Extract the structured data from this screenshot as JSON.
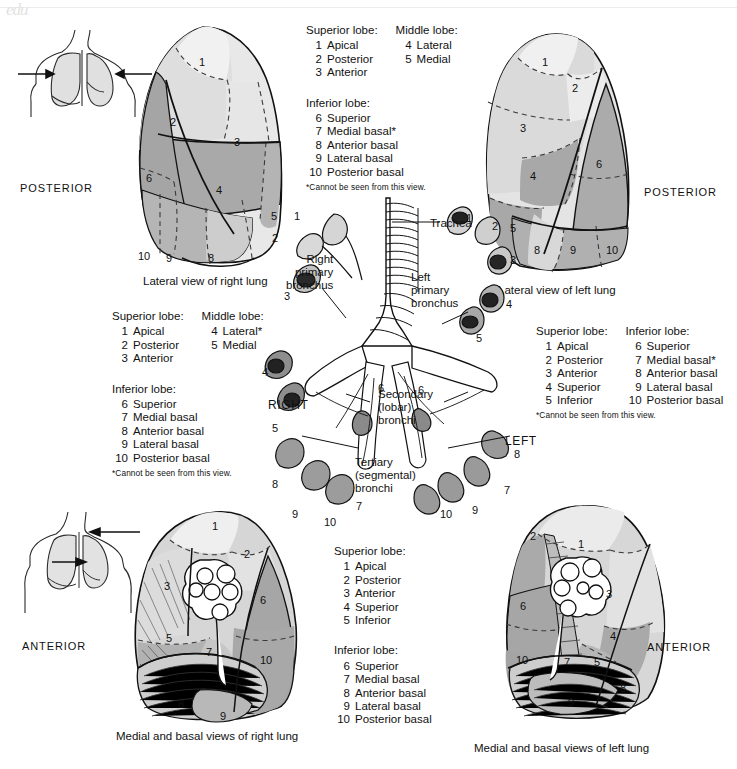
{
  "figure": {
    "title": "Bronchopulmonary segments and bronchial tree",
    "watermark": "edu"
  },
  "orientation_labels": {
    "posterior_left": "POSTERIOR",
    "posterior_right": "POSTERIOR",
    "anterior_left": "ANTERIOR",
    "anterior_right": "ANTERIOR"
  },
  "captions": {
    "lateral_right": "Lateral view of right lung",
    "lateral_left": "Lateral view of left lung",
    "medial_right": "Medial and basal views of right lung",
    "medial_left": "Medial and basal views of left lung"
  },
  "bronchi_labels": {
    "trachea": "Trachea",
    "right_primary": "Right\nprimary\nbronchus",
    "right_primary_lines": [
      "Right",
      "primary",
      "bronchus"
    ],
    "left_primary_lines": [
      "Left",
      "primary",
      "bronchus"
    ],
    "secondary_lines": [
      "Secondary",
      "(lobar)",
      "bronchi"
    ],
    "tertiary_lines": [
      "Tertiary",
      "(segmental)",
      "bronchi"
    ],
    "side_right": "RIGHT",
    "side_left": "LEFT"
  },
  "legends": {
    "top_right_lung": {
      "col1_head": "Superior lobe:",
      "col1": [
        {
          "num": "1",
          "name": "Apical"
        },
        {
          "num": "2",
          "name": "Posterior"
        },
        {
          "num": "3",
          "name": "Anterior"
        }
      ],
      "col2_head": "Middle lobe:",
      "col2": [
        {
          "num": "4",
          "name": "Lateral"
        },
        {
          "num": "5",
          "name": "Medial"
        }
      ],
      "lower_head": "Inferior lobe:",
      "lower": [
        {
          "num": "6",
          "name": "Superior"
        },
        {
          "num": "7",
          "name": "Medial basal*"
        },
        {
          "num": "8",
          "name": "Anterior basal"
        },
        {
          "num": "9",
          "name": "Lateral basal"
        },
        {
          "num": "10",
          "name": "Posterior basal"
        }
      ],
      "footnote": "*Cannot be seen from this view."
    },
    "middle_right_lung": {
      "col1_head": "Superior lobe:",
      "col1": [
        {
          "num": "1",
          "name": "Apical"
        },
        {
          "num": "2",
          "name": "Posterior"
        },
        {
          "num": "3",
          "name": "Anterior"
        }
      ],
      "col2_head": "Middle lobe:",
      "col2": [
        {
          "num": "4",
          "name": "Lateral*"
        },
        {
          "num": "5",
          "name": "Medial"
        }
      ],
      "lower_head": "Inferior lobe:",
      "lower": [
        {
          "num": "6",
          "name": "Superior"
        },
        {
          "num": "7",
          "name": "Medial basal"
        },
        {
          "num": "8",
          "name": "Anterior basal"
        },
        {
          "num": "9",
          "name": "Lateral basal"
        },
        {
          "num": "10",
          "name": "Posterior basal"
        }
      ],
      "footnote": "*Cannot be seen from this view."
    },
    "middle_left_lung": {
      "col1_head": "Superior lobe:",
      "col1": [
        {
          "num": "1",
          "name": "Apical"
        },
        {
          "num": "2",
          "name": "Posterior"
        },
        {
          "num": "3",
          "name": "Anterior"
        },
        {
          "num": "4",
          "name": "Superior"
        },
        {
          "num": "5",
          "name": "Inferior"
        }
      ],
      "col2_head": "Inferior lobe:",
      "col2": [
        {
          "num": "6",
          "name": "Superior"
        },
        {
          "num": "7",
          "name": "Medial basal*"
        },
        {
          "num": "8",
          "name": "Anterior basal"
        },
        {
          "num": "9",
          "name": "Lateral basal"
        },
        {
          "num": "10",
          "name": "Posterior basal"
        }
      ],
      "footnote": "*Cannot be seen from this view."
    },
    "bottom_center": {
      "col1_head": "Superior lobe:",
      "col1": [
        {
          "num": "1",
          "name": "Apical"
        },
        {
          "num": "2",
          "name": "Posterior"
        },
        {
          "num": "3",
          "name": "Anterior"
        },
        {
          "num": "4",
          "name": "Superior"
        },
        {
          "num": "5",
          "name": "Inferior"
        }
      ],
      "lower_head": "Inferior lobe:",
      "lower": [
        {
          "num": "6",
          "name": "Superior"
        },
        {
          "num": "7",
          "name": "Medial basal"
        },
        {
          "num": "8",
          "name": "Anterior basal"
        },
        {
          "num": "9",
          "name": "Lateral basal"
        },
        {
          "num": "10",
          "name": "Posterior basal"
        }
      ]
    }
  },
  "segment_numbers": {
    "lateral_right_lung": [
      "1",
      "2",
      "3",
      "6",
      "4",
      "5",
      "10",
      "9",
      "8"
    ],
    "lateral_left_lung": [
      "1",
      "2",
      "3",
      "4",
      "6",
      "5",
      "8",
      "9",
      "10"
    ],
    "medial_right_lung": [
      "1",
      "2",
      "3",
      "6",
      "5",
      "7",
      "10",
      "8",
      "9"
    ],
    "medial_left_lung": [
      "2",
      "1",
      "6",
      "3",
      "4",
      "10",
      "7",
      "5",
      "8",
      "9"
    ],
    "bronchial_tree_right": [
      "1",
      "2",
      "3",
      "4",
      "5",
      "6",
      "8",
      "7",
      "9",
      "10"
    ],
    "bronchial_tree_left": [
      "1",
      "2",
      "3",
      "4",
      "5",
      "6",
      "8",
      "7",
      "9",
      "10"
    ]
  },
  "colors": {
    "light": "#e4e4e4",
    "lighter": "#efefef",
    "mid": "#cfcfcf",
    "dark": "#a9a9a9",
    "darker": "#959595",
    "outline": "#1c1c1c",
    "background": "#ffffff"
  }
}
